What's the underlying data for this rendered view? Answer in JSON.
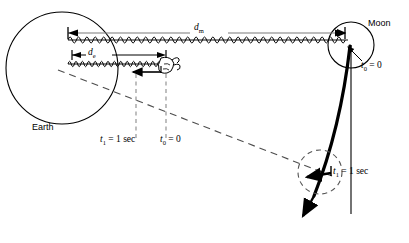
{
  "figure": {
    "type": "physics-diagram",
    "background_color": "#ffffff",
    "line_color": "#000000",
    "dim_line_color": "#7a7a7a",
    "dash_color": "#8a8a8a"
  },
  "bodies": {
    "earth": {
      "label": "Earth",
      "cx": 62,
      "cy": 68,
      "r": 56
    },
    "moon": {
      "label": "Moon",
      "cx": 351,
      "cy": 45,
      "r": 23
    },
    "moon_t1": {
      "cx": 320,
      "cy": 172,
      "r": 22,
      "style": "dashed"
    }
  },
  "dimensions": {
    "moon_distance": {
      "symbol": "d",
      "subscript": "m",
      "x1": 68,
      "x2": 345,
      "y": 33
    },
    "earth_distance": {
      "symbol": "d",
      "subscript": "e",
      "x1": 72,
      "x2": 166,
      "y": 55
    }
  },
  "springs": {
    "upper": {
      "x1": 68,
      "x2": 348,
      "y": 40,
      "state": "relaxed",
      "coils": 66
    },
    "lower": {
      "x1": 68,
      "x2": 163,
      "y": 64,
      "state": "compressed",
      "coils": 30
    }
  },
  "hand": {
    "label": "hand-gripping-spring-end",
    "x": 162,
    "y": 65
  },
  "annotations": {
    "t0_moon": {
      "symbol": "t",
      "subscript": "0",
      "value": "0",
      "text": "t0 = 0"
    },
    "t1_trajectory": {
      "symbol": "t",
      "subscript": "1",
      "value": "1 sec",
      "text": "t1 = 1 sec"
    },
    "t1_bottom": {
      "symbol": "t",
      "subscript": "1",
      "value": "1 sec",
      "text": "t1 = 1 sec",
      "guide_x": 136
    },
    "t0_bottom": {
      "symbol": "t",
      "subscript": "0",
      "value": "0",
      "text": "t0 = 0",
      "guide_x": 166
    }
  },
  "guides": {
    "sight_line": {
      "x1": 58,
      "y1": 70,
      "x2": 330,
      "y2": 175,
      "style": "dashed"
    },
    "vertical_from_moon": {
      "x": 351,
      "y1": 45,
      "y2": 215
    },
    "dashed_vertical_t1": {
      "x": 136,
      "y1": 74,
      "y2": 141
    },
    "dashed_vertical_t0": {
      "x": 166,
      "y1": 74,
      "y2": 141
    }
  },
  "arrows": {
    "hand_pull": {
      "x1": 160,
      "y1": 72,
      "x2": 130,
      "y2": 72,
      "direction": "left"
    },
    "moon_tick": {
      "x1": 337,
      "y1": 33,
      "x2": 347,
      "y2": 33,
      "direction": "right"
    },
    "t0_pointer": {
      "from": [
        360,
        62
      ],
      "to": [
        347,
        48
      ]
    },
    "t1_pointer": {
      "from": [
        330,
        172
      ],
      "to": [
        308,
        176
      ]
    },
    "trajectory": {
      "description": "curved path from moon downward-left with arrowhead"
    }
  }
}
